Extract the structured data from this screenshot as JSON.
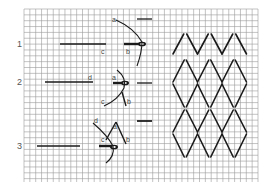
{
  "diagram": {
    "grid": {
      "x0": 24,
      "y0": 9,
      "x1": 258,
      "y1": 182,
      "cell": 5.85,
      "line_color": "#9a9a9a",
      "border_color": "#8a8a8a"
    },
    "colors": {
      "thread": "#1a1a1a",
      "label": "#444444",
      "step_number": "#555555"
    },
    "steps": [
      {
        "number": "1",
        "labels": {
          "a": "a",
          "b": "b",
          "c": "c"
        }
      },
      {
        "number": "2",
        "labels": {
          "a": "a",
          "b": "b",
          "c": "c",
          "d": "d"
        }
      },
      {
        "number": "3",
        "labels": {
          "a": "a",
          "b": "b",
          "c": "c",
          "d": "d"
        }
      }
    ],
    "worked_pattern": {
      "columns": 3,
      "rows_of_diamonds": 3,
      "description": "Zigzag top row followed by lattice of elongated diamonds"
    }
  }
}
